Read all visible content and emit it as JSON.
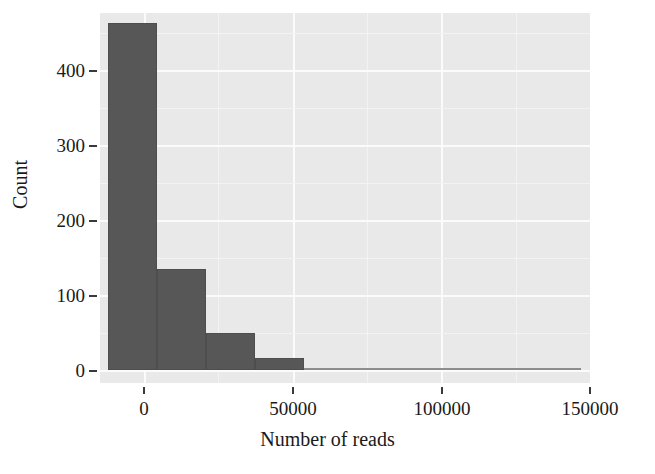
{
  "chart_data": {
    "type": "bar",
    "title": "",
    "subtitle": "",
    "xlabel": "Number of reads",
    "ylabel": "Count",
    "xlim": [
      -9500,
      151000
    ],
    "ylim": [
      -17,
      457
    ],
    "xticks": [
      0,
      50000,
      100000,
      150000
    ],
    "xticklabels": [
      "0",
      "50000",
      "100000",
      "150000"
    ],
    "yticks": [
      0,
      100,
      200,
      300,
      400
    ],
    "yticklabels": [
      "0",
      "100",
      "200",
      "300",
      "400"
    ],
    "grid": true,
    "grid_color": "#fbfbfb",
    "panel_color": "#e9e9e9",
    "bar_color": "#575757",
    "legend": "none",
    "bin_width": 16000,
    "bins": [
      {
        "x_start": -6800,
        "x_end": 9200,
        "center": 1200,
        "count": 444
      },
      {
        "x_start": 9200,
        "x_end": 25200,
        "center": 17200,
        "count": 130
      },
      {
        "x_start": 25200,
        "x_end": 41200,
        "center": 33200,
        "count": 48
      },
      {
        "x_start": 41200,
        "x_end": 57200,
        "center": 49200,
        "count": 16
      },
      {
        "x_start": 57200,
        "x_end": 73200,
        "center": 65200,
        "count": 1
      },
      {
        "x_start": 73200,
        "x_end": 89200,
        "center": 81200,
        "count": 1
      },
      {
        "x_start": 89200,
        "x_end": 105200,
        "center": 97200,
        "count": 1
      },
      {
        "x_start": 105200,
        "x_end": 121200,
        "center": 113200,
        "count": 1
      },
      {
        "x_start": 121200,
        "x_end": 137200,
        "center": 129200,
        "count": 1
      },
      {
        "x_start": 137200,
        "x_end": 148000,
        "center": 142600,
        "count": 1
      }
    ],
    "categories": [
      "1200",
      "17200",
      "33200",
      "49200",
      "65200",
      "81200",
      "97200",
      "113200",
      "129200",
      "142600"
    ],
    "values": [
      444,
      130,
      48,
      16,
      1,
      1,
      1,
      1,
      1,
      1
    ]
  }
}
